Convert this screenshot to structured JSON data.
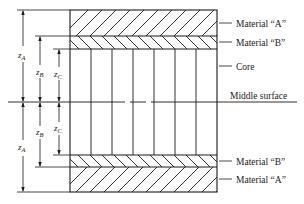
{
  "diagram": {
    "type": "sandwich-laminate-cross-section",
    "labels": {
      "material_a_top": "Material “A”",
      "material_b_top": "Material “B”",
      "core": "Core",
      "middle_surface": "Middle surface",
      "material_b_bottom": "Material “B”",
      "material_a_bottom": "Material “A”"
    },
    "dimensions": [
      {
        "symbol": "z",
        "subscript": "A"
      },
      {
        "symbol": "z",
        "subscript": "B"
      },
      {
        "symbol": "z",
        "subscript": "C"
      }
    ],
    "layers_top_to_bottom": [
      "Material A",
      "Material B",
      "Core",
      "Material B",
      "Material A"
    ],
    "colors": {
      "line": "#1a1a1a",
      "background": "#ffffff"
    }
  }
}
